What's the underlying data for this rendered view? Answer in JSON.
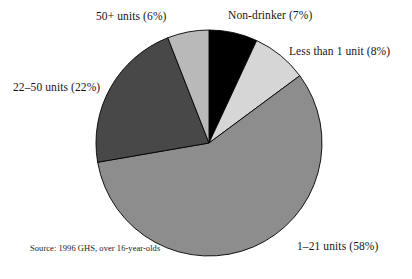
{
  "chart_data": {
    "type": "pie",
    "title": "",
    "subtitle": "",
    "xlabel": "",
    "ylabel": "",
    "legend_position": "around-slices",
    "grid": false,
    "start_angle_deg": 0,
    "direction": "clockwise",
    "categories": [
      "Non-drinker",
      "Less than 1 unit",
      "1–21 units",
      "22–50 units",
      "50+ units"
    ],
    "values": [
      7,
      8,
      58,
      22,
      6
    ],
    "value_unit": "%",
    "labels": [
      "Non-drinker (7%)",
      "Less than 1 unit (8%)",
      "1–21 units (58%)",
      "22–50 units (22%)",
      "50+ units (6%)"
    ],
    "colors": [
      "#000000",
      "#d6d6d6",
      "#8d8d8d",
      "#484848",
      "#b9b9b9"
    ],
    "slice_outline_color": "#000000",
    "annotations": [
      "Source: 1996 GHS, over 16-year-olds"
    ]
  },
  "pie": {
    "center_x": 209,
    "center_y": 143,
    "radius": 113,
    "slices": [
      {
        "key": "non-drinker",
        "label": "Non-drinker (7%)",
        "value": 7,
        "color": "#000000"
      },
      {
        "key": "less-than-1-unit",
        "label": "Less than 1 unit (8%)",
        "value": 8,
        "color": "#d6d6d6"
      },
      {
        "key": "1-21-units",
        "label": "1–21 units (58%)",
        "value": 58,
        "color": "#8d8d8d"
      },
      {
        "key": "22-50-units",
        "label": "22–50 units (22%)",
        "value": 22,
        "color": "#484848"
      },
      {
        "key": "50-plus-units",
        "label": "50+ units (6%)",
        "value": 6,
        "color": "#b9b9b9"
      }
    ]
  },
  "labels": {
    "fifty_plus": "50+ units (6%)",
    "non_drinker": "Non-drinker (7%)",
    "less_than_one": "Less than 1 unit (8%)",
    "twentytwo_to_fifty": "22–50 units (22%)",
    "one_to_twentyone": "1–21 units (58%)"
  },
  "source": {
    "note": "Source: 1996 GHS, over 16-year-olds"
  }
}
